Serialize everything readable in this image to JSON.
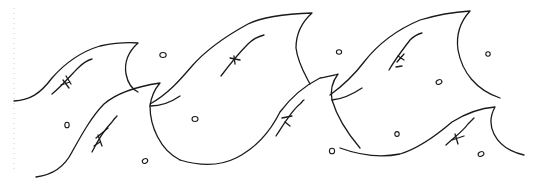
{
  "illustration": {
    "subject": "wave pattern line drawing",
    "stroke_color": "#1a1a1a",
    "background_color": "#ffffff",
    "border_color": "#cfcfcf",
    "wave_count": 5,
    "bubble_count": 9
  }
}
